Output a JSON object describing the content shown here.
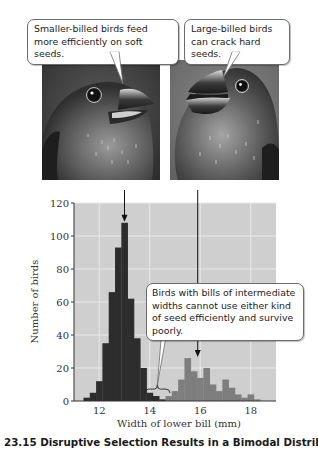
{
  "callouts": {
    "small_billed": "Smaller-billed birds feed more efficiently on soft seeds.",
    "large_billed": "Large-billed birds can crack hard seeds.",
    "intermediate": "Birds with bills of intermediate widths cannot use either kind of seed efficiently and survive poorly."
  },
  "images": {
    "left": "small-billed-bird-illustration",
    "right": "large-billed-bird-illustration"
  },
  "caption": "23.15  Disruptive Selection Results in a Bimodal Distribution",
  "colors": {
    "plot_bg": "#cfcfcf",
    "grid": "#e8e8e8",
    "small_bill_bars": "#2d2d2d",
    "large_bill_bars": "#7e7e7e"
  },
  "chart_data": {
    "type": "bar",
    "title": "",
    "xlabel": "Width of lower bill (mm)",
    "ylabel": "Number of birds",
    "xlim": [
      11,
      19
    ],
    "ylim": [
      0,
      120
    ],
    "x_ticks": [
      12,
      14,
      16,
      18
    ],
    "y_ticks": [
      0,
      20,
      40,
      60,
      80,
      100,
      120
    ],
    "grid": true,
    "bin_width": 0.25,
    "series": [
      {
        "name": "Small-billed birds",
        "color": "#2d2d2d",
        "x": [
          11.5,
          11.75,
          12.0,
          12.25,
          12.5,
          12.75,
          13.0,
          13.25,
          13.5,
          13.75,
          14.0,
          14.25,
          14.5
        ],
        "values": [
          2,
          5,
          12,
          35,
          66,
          93,
          108,
          62,
          38,
          20,
          5,
          3,
          1
        ]
      },
      {
        "name": "Large-billed birds",
        "color": "#7e7e7e",
        "x": [
          14.75,
          15.0,
          15.25,
          15.5,
          15.75,
          16.0,
          16.25,
          16.5,
          16.75,
          17.0,
          17.25,
          17.5,
          17.75,
          18.0,
          18.25
        ],
        "values": [
          3,
          6,
          13,
          26,
          18,
          14,
          20,
          10,
          6,
          13,
          8,
          4,
          2,
          4,
          1
        ]
      }
    ],
    "annotations": [
      {
        "text": "Smaller-billed birds feed more efficiently on soft seeds.",
        "points_to_x": 13.0
      },
      {
        "text": "Large-billed birds can crack hard seeds.",
        "points_to_x": 15.9
      },
      {
        "text": "Birds with bills of intermediate widths cannot use either kind of seed efficiently and survive poorly.",
        "points_to_range": [
          13.8,
          14.8
        ]
      }
    ]
  }
}
